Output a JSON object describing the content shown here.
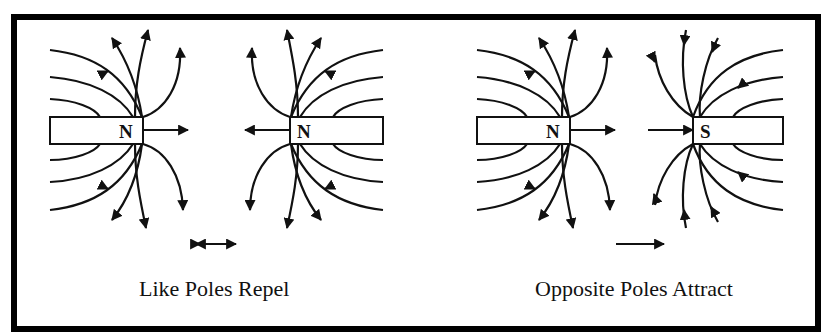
{
  "colors": {
    "ink": "#111111",
    "background": "#ffffff",
    "frame": "#000000"
  },
  "panels": [
    {
      "id": "like-poles",
      "caption": "Like Poles Repel",
      "magnets": [
        {
          "pole_label": "N",
          "side": "left"
        },
        {
          "pole_label": "N",
          "side": "right"
        }
      ],
      "force_indicator": "double-arrow (repulsion)"
    },
    {
      "id": "opposite-poles",
      "caption": "Opposite Poles Attract",
      "magnets": [
        {
          "pole_label": "N",
          "side": "left"
        },
        {
          "pole_label": "S",
          "side": "right"
        }
      ],
      "force_indicator": "single-arrow (attraction)"
    }
  ]
}
